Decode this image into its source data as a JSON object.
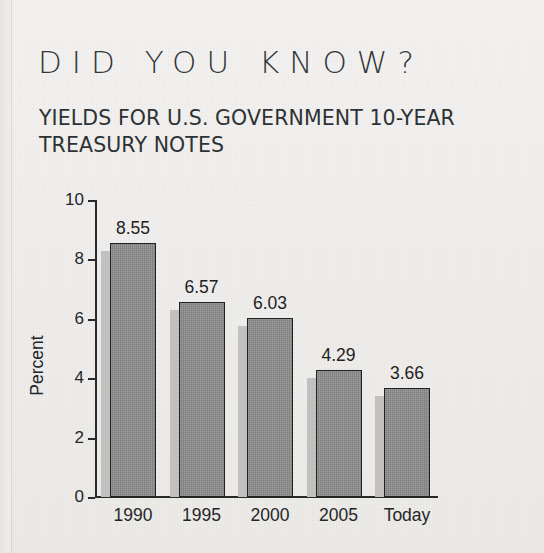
{
  "headline": "DID YOU KNOW?",
  "subtitle": "YIELDS FOR U.S. GOVERNMENT 10-YEAR TREASURY NOTES",
  "chart_data": {
    "type": "bar",
    "title": "YIELDS FOR U.S. GOVERNMENT 10-YEAR TREASURY NOTES",
    "xlabel": "",
    "ylabel": "Percent",
    "categories": [
      "1990",
      "1995",
      "2000",
      "2005",
      "Today"
    ],
    "values": [
      8.55,
      6.57,
      6.03,
      4.29,
      3.66
    ],
    "value_labels": [
      "8.55",
      "6.57",
      "6.03",
      "4.29",
      "3.66"
    ],
    "ylim": [
      0,
      10
    ],
    "yticks": [
      0,
      2,
      4,
      6,
      8,
      10
    ],
    "ytick_labels": [
      "0",
      "2",
      "4",
      "6",
      "8",
      "10"
    ],
    "grid": false,
    "legend": "none",
    "bar_color": "#8b8b8b",
    "bar_edge_color": "#1f2122",
    "bar_shadow_color": "#c3c2c0",
    "axis_color": "#2a2a2a",
    "background_color": "#f1f0ee",
    "text_color": "#242729"
  }
}
